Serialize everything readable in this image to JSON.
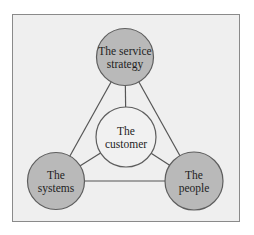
{
  "diagram": {
    "title": "",
    "colors": {
      "page_background": "#ffffff",
      "frame_background": "#efefef",
      "frame_border": "#8a8a8a",
      "outer_node_fill": "#b9b9b9",
      "center_node_fill": "#f1f1f1",
      "node_border": "#5e5e5e",
      "edge": "#555555"
    },
    "nodes": [
      {
        "id": "service-strategy",
        "role": "outer",
        "lines": [
          "The service",
          "strategy"
        ]
      },
      {
        "id": "customer",
        "role": "center",
        "lines": [
          "The",
          "customer"
        ]
      },
      {
        "id": "systems",
        "role": "outer",
        "lines": [
          "The",
          "systems"
        ]
      },
      {
        "id": "people",
        "role": "outer",
        "lines": [
          "The",
          "people"
        ]
      }
    ],
    "edges": [
      {
        "from": "service-strategy",
        "to": "systems"
      },
      {
        "from": "service-strategy",
        "to": "people"
      },
      {
        "from": "systems",
        "to": "people"
      },
      {
        "from": "customer",
        "to": "service-strategy"
      },
      {
        "from": "customer",
        "to": "systems"
      },
      {
        "from": "customer",
        "to": "people"
      }
    ]
  }
}
